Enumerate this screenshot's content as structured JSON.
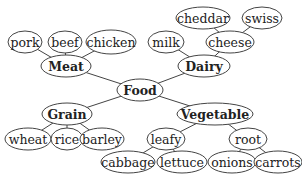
{
  "diagram": {
    "type": "concept-tree",
    "root": "Food",
    "nodes": [
      {
        "id": "food",
        "label": "Food",
        "bold": true,
        "x": 140,
        "y": 90,
        "rx": 23,
        "ry": 11
      },
      {
        "id": "meat",
        "label": "Meat",
        "bold": true,
        "x": 66,
        "y": 66,
        "rx": 25,
        "ry": 11
      },
      {
        "id": "dairy",
        "label": "Dairy",
        "bold": true,
        "x": 204,
        "y": 66,
        "rx": 26,
        "ry": 11
      },
      {
        "id": "grain",
        "label": "Grain",
        "bold": true,
        "x": 67,
        "y": 114,
        "rx": 25,
        "ry": 11
      },
      {
        "id": "vegetable",
        "label": "Vegetable",
        "bold": true,
        "x": 215,
        "y": 114,
        "rx": 38,
        "ry": 11
      },
      {
        "id": "pork",
        "label": "pork",
        "x": 25,
        "y": 42,
        "rx": 17,
        "ry": 11
      },
      {
        "id": "beef",
        "label": "beef",
        "x": 65,
        "y": 42,
        "rx": 17,
        "ry": 11
      },
      {
        "id": "chicken",
        "label": "chicken",
        "x": 111,
        "y": 42,
        "rx": 25,
        "ry": 12
      },
      {
        "id": "milk",
        "label": "milk",
        "x": 166,
        "y": 42,
        "rx": 18,
        "ry": 11
      },
      {
        "id": "cheese",
        "label": "cheese",
        "x": 230,
        "y": 42,
        "rx": 24,
        "ry": 11
      },
      {
        "id": "cheddar",
        "label": "cheddar",
        "x": 203,
        "y": 18,
        "rx": 27,
        "ry": 11
      },
      {
        "id": "swiss",
        "label": "swiss",
        "x": 262,
        "y": 18,
        "rx": 20,
        "ry": 11
      },
      {
        "id": "wheat",
        "label": "wheat",
        "x": 28,
        "y": 139,
        "rx": 23,
        "ry": 11
      },
      {
        "id": "rice",
        "label": "rice",
        "x": 67,
        "y": 139,
        "rx": 16,
        "ry": 11
      },
      {
        "id": "barley",
        "label": "barley",
        "x": 102,
        "y": 139,
        "rx": 22,
        "ry": 11
      },
      {
        "id": "leafy",
        "label": "leafy",
        "x": 166,
        "y": 139,
        "rx": 19,
        "ry": 11
      },
      {
        "id": "root",
        "label": "root",
        "x": 248,
        "y": 139,
        "rx": 19,
        "ry": 11
      },
      {
        "id": "cabbage",
        "label": "cabbage",
        "x": 128,
        "y": 162,
        "rx": 27,
        "ry": 11
      },
      {
        "id": "lettuce",
        "label": "lettuce",
        "x": 182,
        "y": 162,
        "rx": 25,
        "ry": 11
      },
      {
        "id": "onions",
        "label": "onions",
        "x": 232,
        "y": 162,
        "rx": 24,
        "ry": 11
      },
      {
        "id": "carrots",
        "label": "carrots",
        "x": 278,
        "y": 162,
        "rx": 24,
        "ry": 11
      }
    ],
    "edges": [
      [
        "food",
        "meat"
      ],
      [
        "food",
        "dairy"
      ],
      [
        "food",
        "grain"
      ],
      [
        "food",
        "vegetable"
      ],
      [
        "meat",
        "pork"
      ],
      [
        "meat",
        "beef"
      ],
      [
        "meat",
        "chicken"
      ],
      [
        "dairy",
        "milk"
      ],
      [
        "dairy",
        "cheese"
      ],
      [
        "cheese",
        "cheddar"
      ],
      [
        "cheese",
        "swiss"
      ],
      [
        "grain",
        "wheat"
      ],
      [
        "grain",
        "rice"
      ],
      [
        "grain",
        "barley"
      ],
      [
        "vegetable",
        "leafy"
      ],
      [
        "vegetable",
        "root"
      ],
      [
        "leafy",
        "cabbage"
      ],
      [
        "leafy",
        "lettuce"
      ],
      [
        "root",
        "onions"
      ],
      [
        "root",
        "carrots"
      ]
    ]
  }
}
